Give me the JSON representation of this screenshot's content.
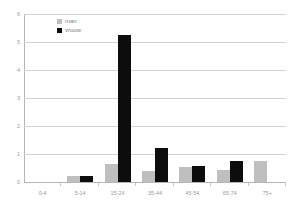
{
  "chart_data": {
    "type": "bar",
    "title": "",
    "xlabel": "",
    "ylabel": "",
    "ylim": [
      0,
      6
    ],
    "yticks": [
      0,
      1,
      2,
      3,
      4,
      5,
      6
    ],
    "ytick_labels": [
      "0",
      "1",
      "2",
      "3",
      "4",
      "5",
      "6"
    ],
    "grid": true,
    "legend_position": "top-left-inside",
    "categories": [
      "0-4",
      "5-14",
      "15-24",
      "35-44",
      "45-54",
      "65-74",
      "75+"
    ],
    "series": [
      {
        "name": "man",
        "color": "#bfbfbf",
        "values": [
          0,
          0.22,
          0.65,
          0.4,
          0.55,
          0.43,
          0.75
        ]
      },
      {
        "name": "vrouw",
        "color": "#0d0d0d",
        "values": [
          0,
          0.23,
          5.25,
          1.22,
          0.58,
          0.75,
          0
        ]
      }
    ]
  },
  "legend": {
    "items": [
      {
        "label": "man",
        "swatch": "legend-swatch-man"
      },
      {
        "label": "vrouw",
        "swatch": "legend-swatch-vrouw"
      }
    ]
  },
  "axes": {
    "y_tick_labels": [
      "6",
      "5",
      "4",
      "3",
      "2",
      "1",
      "0"
    ],
    "x_tick_labels": [
      "0-4",
      "5-14",
      "15-24",
      "35-44",
      "45-54",
      "65-74",
      "75+"
    ]
  }
}
